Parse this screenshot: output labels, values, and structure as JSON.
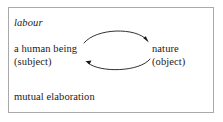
{
  "figure": {
    "title_term": "labour",
    "caption_term": "mutual elaboration",
    "frame_border_color": "#a9a9a9",
    "background_color": "#ffffff",
    "text_color": "#1a1a1a",
    "arrow_color": "#1a1a1a"
  },
  "nodes": {
    "left": {
      "term": "a human being",
      "qualifier": "(subject)"
    },
    "right": {
      "term": "nature",
      "qualifier": "(object)"
    }
  },
  "arrows": [
    {
      "name": "subject-to-object-arrow",
      "from": "a human being (subject)",
      "to": "nature (object)",
      "direction": "left-to-right",
      "curve": "arc-above"
    },
    {
      "name": "object-to-subject-arrow",
      "from": "nature (object)",
      "to": "a human being (subject)",
      "direction": "right-to-left",
      "curve": "arc-below"
    }
  ]
}
